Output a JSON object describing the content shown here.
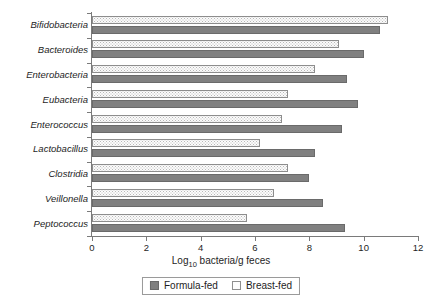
{
  "chart_data": {
    "type": "bar",
    "orientation": "horizontal",
    "title": "",
    "xlabel": "Log10 bacteria/g feces",
    "xlabel_base": "Log",
    "xlabel_sub": "10",
    "xlabel_rest": " bacteria/g feces",
    "ylabel": "",
    "xlim": [
      0,
      12
    ],
    "xticks": [
      0,
      2,
      4,
      6,
      8,
      10,
      12
    ],
    "xtick_labels": [
      "0",
      "2",
      "4",
      "6",
      "8",
      "10",
      "12"
    ],
    "grid": false,
    "legend_position": "bottom-center",
    "categories": [
      "Bifidobacteria",
      "Bacteroides",
      "Enterobacteria",
      "Eubacteria",
      "Enterococcus",
      "Lactobacillus",
      "Clostridia",
      "Veillonella",
      "Peptococcus"
    ],
    "series": [
      {
        "name": "Breast-fed",
        "color": "#fbfbfb",
        "pattern": "dotted",
        "values": [
          10.9,
          9.1,
          8.2,
          7.2,
          7.0,
          6.2,
          7.2,
          6.7,
          5.7
        ]
      },
      {
        "name": "Formula-fed",
        "color": "#808080",
        "pattern": "solid",
        "values": [
          10.6,
          10.0,
          9.4,
          9.8,
          9.2,
          8.2,
          8.0,
          8.5,
          9.3
        ]
      }
    ],
    "legend": [
      {
        "label": "Formula-fed",
        "swatch": "solid-gray"
      },
      {
        "label": "Breast-fed",
        "swatch": "white-dotted"
      }
    ]
  }
}
